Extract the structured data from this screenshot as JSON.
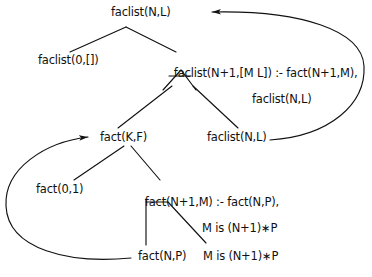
{
  "diagram": {
    "nodes": {
      "root": {
        "text": "faclist(N,L)",
        "x": 111,
        "y": 6
      },
      "faclist_base": {
        "text": "faclist(0,[])",
        "x": 38,
        "y": 54
      },
      "faclist_rule_head": {
        "text": "faclist(N+1,[M L]) :- fact(N+1,M),",
        "x": 160,
        "y": 54
      },
      "faclist_rule_body2": {
        "text": "faclist(N,L)",
        "x": 252,
        "y": 67
      },
      "fact_kf": {
        "text": "fact(K,F)",
        "x": 100,
        "y": 131
      },
      "faclist_nl_mid": {
        "text": "faclist(N,L)",
        "x": 207,
        "y": 131
      },
      "fact_base": {
        "text": "fact(0,1)",
        "x": 36,
        "y": 183
      },
      "fact_rule_head": {
        "text": "fact(N+1,M) :- fact(N,P),",
        "x": 131,
        "y": 183
      },
      "fact_rule_body2": {
        "text": "M is (N+1)∗P",
        "x": 202,
        "y": 196
      },
      "fact_np_leaf": {
        "text": "fact(N,P)",
        "x": 138,
        "y": 250
      },
      "m_is_leaf": {
        "text": "M is (N+1)∗P",
        "x": 203,
        "y": 250
      }
    },
    "colors": {
      "ink": "#111111",
      "background": "#ffffff"
    }
  }
}
